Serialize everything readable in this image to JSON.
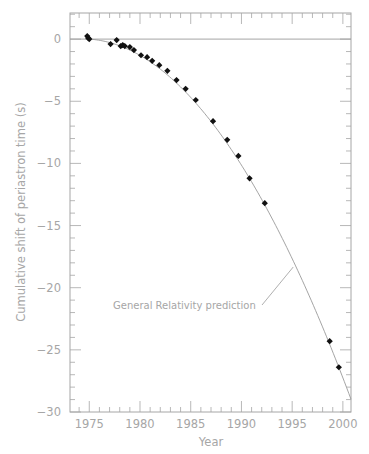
{
  "chart_data": {
    "type": "scatter",
    "title": "",
    "xlabel": "Year",
    "ylabel": "Cumulative shift of periastron time (s)",
    "xlim": [
      1973.1,
      2000.8
    ],
    "ylim": [
      -30,
      2.1
    ],
    "grid": false,
    "x_ticks": [
      1975,
      1980,
      1985,
      1990,
      1995,
      2000
    ],
    "x_tick_labels": [
      "1975",
      "1980",
      "1985",
      "1990",
      "1995",
      "2000"
    ],
    "y_ticks": [
      0,
      -5,
      -10,
      -15,
      -20,
      -25,
      -30
    ],
    "y_tick_labels": [
      "0",
      "−5",
      "−10",
      "−15",
      "−20",
      "−25",
      "−30"
    ],
    "series": [
      {
        "name": "Observed",
        "style": "markers",
        "color": "#111111",
        "x": [
          1974.8,
          1974.9,
          1975.0,
          1977.1,
          1977.7,
          1978.1,
          1978.3,
          1978.5,
          1979.0,
          1979.4,
          1980.1,
          1980.7,
          1981.2,
          1981.9,
          1982.7,
          1983.6,
          1984.5,
          1985.5,
          1987.2,
          1988.6,
          1989.7,
          1990.8,
          1992.3,
          1998.7,
          1999.6
        ],
        "y": [
          0.24,
          0.08,
          0.0,
          -0.4,
          -0.08,
          -0.56,
          -0.48,
          -0.56,
          -0.64,
          -0.88,
          -1.3,
          -1.45,
          -1.75,
          -2.1,
          -2.55,
          -3.3,
          -4.0,
          -4.9,
          -6.6,
          -8.1,
          -9.4,
          -11.2,
          -13.2,
          -24.3,
          -26.4
        ]
      },
      {
        "name": "General Relativity prediction",
        "style": "line",
        "color": "#9a9a9a",
        "model": "y = a*(t-1975)^2 + b*(t-1975)",
        "a": -0.0414,
        "b": -0.055,
        "x_range": [
          1974.6,
          2000.8
        ]
      },
      {
        "name": "Zero reference",
        "style": "line",
        "color": "#9a9a9a",
        "y_const": 0
      }
    ],
    "annotations": [
      {
        "text": "General Relativity prediction",
        "points_to_x": 1995.3
      }
    ]
  }
}
